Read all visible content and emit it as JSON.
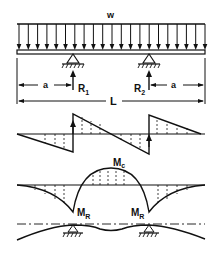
{
  "diagram": {
    "load": {
      "label": "w",
      "type": "uniformly distributed"
    },
    "supports": [
      {
        "name": "left-support",
        "reaction_label": "R",
        "reaction_sub": "1"
      },
      {
        "name": "right-support",
        "reaction_label": "R",
        "reaction_sub": "2"
      }
    ],
    "dimensions": {
      "overhang_left": "a",
      "overhang_right": "a",
      "total_length": "L"
    },
    "shear_diagram": {
      "label": "shear"
    },
    "moment_diagram": {
      "center_moment_label": "M",
      "center_moment_sub": "c",
      "support_moment_label": "M",
      "support_moment_sub": "R"
    },
    "deflection_diagram": {
      "label": "deflected shape"
    }
  }
}
